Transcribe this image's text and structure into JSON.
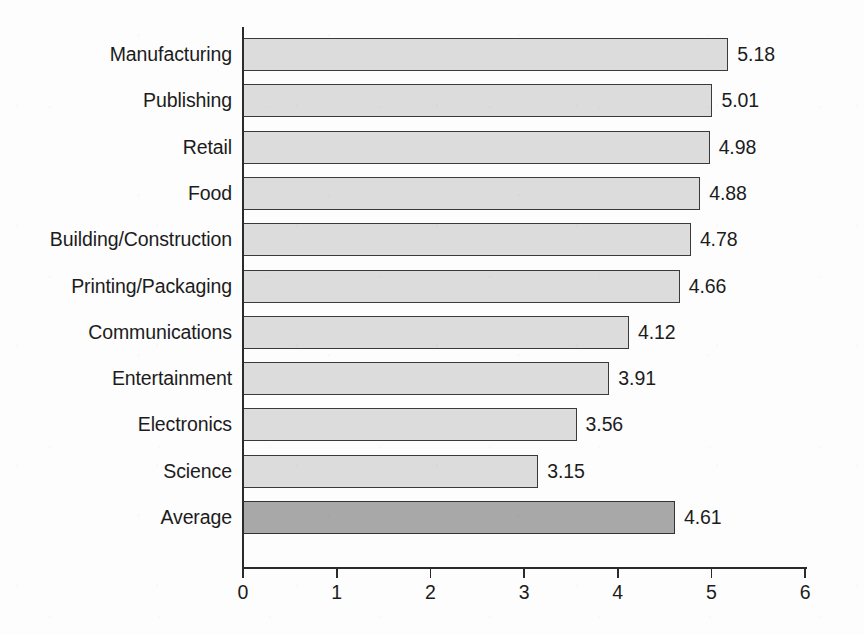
{
  "chart_data": {
    "type": "bar",
    "orientation": "horizontal",
    "title": "",
    "xlabel": "",
    "ylabel": "",
    "xlim": [
      0,
      6
    ],
    "xticks": [
      "0",
      "1",
      "2",
      "3",
      "4",
      "5",
      "6"
    ],
    "grid": false,
    "legend": "none",
    "categories": [
      "Manufacturing",
      "Publishing",
      "Retail",
      "Food",
      "Building/Construction",
      "Printing/Packaging",
      "Communications",
      "Entertainment",
      "Electronics",
      "Science",
      "Average"
    ],
    "values": [
      5.18,
      5.01,
      4.98,
      4.88,
      4.78,
      4.66,
      4.12,
      3.91,
      3.56,
      3.15,
      4.61
    ],
    "value_labels": [
      "5.18",
      "5.01",
      "4.98",
      "4.88",
      "4.78",
      "4.66",
      "4.12",
      "3.91",
      "3.56",
      "3.15",
      "4.61"
    ],
    "highlighted_category": "Average",
    "colors": {
      "bar_fill": "#dcdcdc",
      "bar_border": "#3a3a3a",
      "average_fill": "#a8a8a8",
      "average_border": "#333333",
      "axis": "#2b2b2b",
      "text": "#1c1c1c",
      "background": "#fdfdfd"
    }
  }
}
